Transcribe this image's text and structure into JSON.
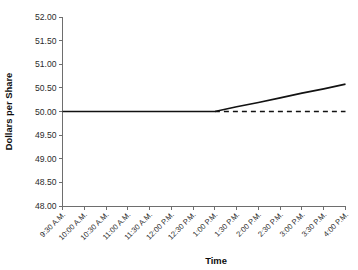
{
  "chart_data": {
    "type": "line",
    "title": "",
    "xlabel": "Time",
    "ylabel": "Dollars per Share",
    "ylim": [
      48.0,
      52.0
    ],
    "ytick_step": 0.5,
    "ytick_labels": [
      "52.00",
      "51.50",
      "51.00",
      "50.50",
      "50.00",
      "49.50",
      "49.00",
      "48.50",
      "48.00"
    ],
    "ytick_values": [
      52.0,
      51.5,
      51.0,
      50.5,
      50.0,
      49.5,
      49.0,
      48.5,
      48.0
    ],
    "categories": [
      "9:30 A.M.",
      "10:00 A.M.",
      "10:30 A.M.",
      "11:00 A.M.",
      "11:30 A.M.",
      "12:00 P.M.",
      "12:30 P.M.",
      "1:00 P.M.",
      "1:30 P.M.",
      "2:00 P.M.",
      "2:30 P.M.",
      "3:00 P.M.",
      "3:30 P.M.",
      "4:00 P.M."
    ],
    "grid": false,
    "legend": "none",
    "series": [
      {
        "name": "Share price",
        "style": "solid",
        "color": "#121212",
        "values": [
          50.0,
          50.0,
          50.0,
          50.0,
          50.0,
          50.0,
          50.0,
          50.0,
          50.1,
          50.19,
          50.29,
          50.39,
          50.48,
          50.58
        ]
      },
      {
        "name": "Reference level",
        "style": "dashed",
        "color": "#121212",
        "values": [
          null,
          null,
          null,
          null,
          null,
          null,
          null,
          50.0,
          50.0,
          50.0,
          50.0,
          50.0,
          50.0,
          50.0
        ]
      }
    ],
    "annotations": []
  }
}
